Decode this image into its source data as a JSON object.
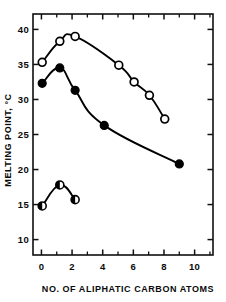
{
  "chart_data": {
    "type": "line",
    "title": "",
    "xlabel": "NO. OF ALIPHATIC CARBON ATOMS",
    "ylabel": "MELTING POINT, °C",
    "xlim": [
      -0.55,
      11.2
    ],
    "ylim": [
      7.8,
      42.2
    ],
    "grid": false,
    "legend": "none",
    "x_ticks_major": [
      0,
      2,
      4,
      6,
      8,
      10
    ],
    "x_tick_labels": [
      "0",
      "2",
      "4",
      "6",
      "8",
      "10"
    ],
    "x_ticks_minor": [
      1,
      3,
      5,
      7,
      9,
      11
    ],
    "y_ticks_major": [
      10,
      15,
      20,
      25,
      30,
      35,
      40
    ],
    "y_tick_labels": [
      "10",
      "15",
      "20",
      "25",
      "30",
      "35",
      "40"
    ],
    "frame": "box",
    "ticks_on_all_sides": true,
    "series": [
      {
        "name": "open-circles",
        "marker": "open-circle",
        "x": [
          0.05,
          1.2,
          2.2,
          5.05,
          6.05,
          7.05,
          8.05
        ],
        "y": [
          35.3,
          38.3,
          39.0,
          34.9,
          32.5,
          30.6,
          27.2
        ]
      },
      {
        "name": "filled-circles",
        "marker": "filled-circle",
        "x": [
          0.05,
          1.2,
          2.2,
          4.1,
          9.0
        ],
        "y": [
          32.3,
          34.5,
          31.3,
          26.3,
          20.8
        ]
      },
      {
        "name": "half-filled-circles",
        "marker": "half-filled-circle",
        "x": [
          0.05,
          1.2,
          2.2
        ],
        "y": [
          14.8,
          17.8,
          15.7
        ]
      }
    ]
  }
}
